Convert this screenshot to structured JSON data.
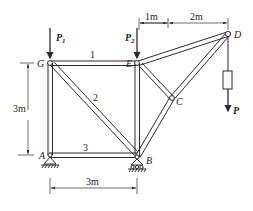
{
  "diagram": {
    "type": "planar truss with loads",
    "nodes": {
      "G": {
        "label": "G",
        "x": 50,
        "y": 63
      },
      "E": {
        "label": "E",
        "x": 137,
        "y": 63
      },
      "A": {
        "label": "A",
        "x": 50,
        "y": 155
      },
      "B": {
        "label": "B",
        "x": 137,
        "y": 157
      },
      "C": {
        "label": "C",
        "x": 172,
        "y": 98
      },
      "D": {
        "label": "D",
        "x": 228,
        "y": 34
      }
    },
    "members": {
      "m1": {
        "label": "1"
      },
      "m2": {
        "label": "2"
      },
      "m3": {
        "label": "3"
      }
    },
    "loads": {
      "p1": {
        "label": "P",
        "sub": "1"
      },
      "p2": {
        "label": "P",
        "sub": "2"
      },
      "p": {
        "label": "P"
      }
    },
    "dimensions": {
      "top_left": "1m",
      "top_right": "2m",
      "left_height": "3m",
      "bottom_width": "3m"
    },
    "colors": {
      "line": "#2b2b2b",
      "background": "#ffffff"
    }
  }
}
